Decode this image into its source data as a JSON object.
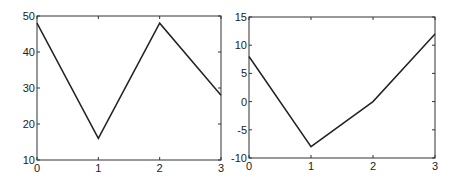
{
  "chart_data": [
    {
      "type": "line",
      "title": "",
      "xlabel": "",
      "ylabel": "",
      "x": [
        0,
        1,
        2,
        3
      ],
      "series": [
        {
          "name": "",
          "values": [
            48,
            16,
            48,
            28
          ]
        }
      ],
      "xlim": [
        0,
        3
      ],
      "ylim": [
        10,
        50
      ],
      "xticks": [
        "0",
        "1",
        "2",
        "3"
      ],
      "yticks": [
        "10",
        "20",
        "30",
        "40",
        "50"
      ],
      "grid": false,
      "legend": "none"
    },
    {
      "type": "line",
      "title": "",
      "xlabel": "",
      "ylabel": "",
      "x": [
        0,
        1,
        2,
        3
      ],
      "series": [
        {
          "name": "",
          "values": [
            8,
            -8,
            0,
            12
          ]
        }
      ],
      "xlim": [
        0,
        3
      ],
      "ylim": [
        -10,
        15
      ],
      "xticks": [
        "0",
        "1",
        "2",
        "3"
      ],
      "yticks": [
        "-10",
        "-5",
        "0",
        "5",
        "10",
        "15"
      ],
      "grid": false,
      "legend": "none"
    }
  ],
  "colors": {
    "line": "#222222",
    "axes": "#333333"
  }
}
